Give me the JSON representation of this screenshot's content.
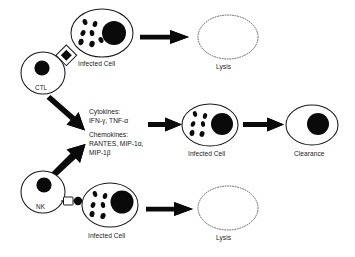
{
  "figure": {
    "background_color": "#ffffff",
    "ink_color": "#0a0a0a",
    "lysed_outline_color": "#555555"
  },
  "effector_cells": {
    "ctl": {
      "label": "CTL",
      "cx": 43,
      "cy": 73,
      "rx": 22,
      "ry": 21,
      "nucleus": {
        "cx": 42,
        "cy": 68,
        "r": 7.6
      },
      "granule": {
        "name": "lytic-granule",
        "cx": 67,
        "cy": 56,
        "outer_half": 8.2,
        "inner_half": 4.4
      }
    },
    "nk": {
      "label": "NK",
      "cx": 43,
      "cy": 192,
      "rx": 22,
      "ry": 21,
      "nucleus": {
        "cx": 44,
        "cy": 185,
        "r": 7.6
      },
      "receptor": {
        "name": "nk-receptor-bridge",
        "box": {
          "x": 63,
          "y": 197,
          "w": 9.5,
          "h": 8
        },
        "knob": {
          "cx": 78,
          "cy": 201,
          "r": 4.2
        }
      }
    }
  },
  "infected_cells": [
    {
      "id": "infected-cell-top",
      "label": "Infected Cell",
      "cx": 102,
      "cy": 33,
      "rx": 31,
      "ry": 24,
      "nucleus": {
        "cx": 114,
        "cy": 33,
        "r": 12
      },
      "virions": [
        {
          "cx": 85,
          "cy": 22,
          "rx": 2.3,
          "ry": 3.1,
          "rot": -18
        },
        {
          "cx": 95,
          "cy": 24,
          "rx": 2.3,
          "ry": 3.1,
          "rot": 12
        },
        {
          "cx": 83,
          "cy": 33,
          "rx": 2.3,
          "ry": 3.1,
          "rot": 25
        },
        {
          "cx": 92,
          "cy": 33,
          "rx": 2.3,
          "ry": 3.1,
          "rot": -10
        },
        {
          "cx": 81,
          "cy": 42,
          "rx": 2.6,
          "ry": 3.2,
          "rot": 8
        },
        {
          "cx": 92,
          "cy": 44,
          "rx": 2.6,
          "ry": 3.2,
          "rot": 20
        },
        {
          "cx": 101,
          "cy": 40,
          "rx": 2.3,
          "ry": 3.1,
          "rot": -25
        }
      ],
      "label_pos": {
        "x": 78,
        "y": 60
      }
    },
    {
      "id": "infected-cell-middle",
      "label": "Infected Cell",
      "cx": 210,
      "cy": 125,
      "rx": 28,
      "ry": 21,
      "nucleus": {
        "cx": 222,
        "cy": 124,
        "r": 11
      },
      "virions": [
        {
          "cx": 195,
          "cy": 114,
          "rx": 2.1,
          "ry": 2.9,
          "rot": -15
        },
        {
          "cx": 205,
          "cy": 116,
          "rx": 2.1,
          "ry": 2.9,
          "rot": 14
        },
        {
          "cx": 193,
          "cy": 124,
          "rx": 2.1,
          "ry": 2.9,
          "rot": 22
        },
        {
          "cx": 203,
          "cy": 124,
          "rx": 2.1,
          "ry": 2.9,
          "rot": -8
        },
        {
          "cx": 192,
          "cy": 133,
          "rx": 2.4,
          "ry": 3.0,
          "rot": 10
        },
        {
          "cx": 202,
          "cy": 134,
          "rx": 2.4,
          "ry": 3.0,
          "rot": 18
        }
      ],
      "label_pos": {
        "x": 188,
        "y": 150
      }
    },
    {
      "id": "infected-cell-bottom",
      "label": "Infected Cell",
      "cx": 110,
      "cy": 205,
      "rx": 28,
      "ry": 22,
      "nucleus": {
        "cx": 122,
        "cy": 202,
        "r": 11.5
      },
      "virions": [
        {
          "cx": 95,
          "cy": 194,
          "rx": 2.2,
          "ry": 3.0,
          "rot": -16
        },
        {
          "cx": 105,
          "cy": 196,
          "rx": 2.2,
          "ry": 3.0,
          "rot": 13
        },
        {
          "cx": 93,
          "cy": 205,
          "rx": 2.2,
          "ry": 3.0,
          "rot": 24
        },
        {
          "cx": 103,
          "cy": 205,
          "rx": 2.2,
          "ry": 3.0,
          "rot": -9
        },
        {
          "cx": 92,
          "cy": 214,
          "rx": 2.5,
          "ry": 3.1,
          "rot": 9
        },
        {
          "cx": 103,
          "cy": 216,
          "rx": 2.5,
          "ry": 3.1,
          "rot": 19
        }
      ],
      "label_pos": {
        "x": 88,
        "y": 232
      }
    }
  ],
  "outcomes": [
    {
      "id": "outcome-lysis-top",
      "label": "Lysis",
      "type": "lysed",
      "cx": 228,
      "cy": 37,
      "rx": 30,
      "ry": 22,
      "label_pos": {
        "x": 215,
        "y": 62
      }
    },
    {
      "id": "outcome-clearance",
      "label": "Clearance",
      "type": "cleared",
      "cx": 312,
      "cy": 125,
      "rx": 26,
      "ry": 20,
      "nucleus": {
        "cx": 318,
        "cy": 124,
        "r": 11
      },
      "label_pos": {
        "x": 294,
        "y": 150
      }
    },
    {
      "id": "outcome-lysis-bottom",
      "label": "Lysis",
      "type": "lysed",
      "cx": 228,
      "cy": 208,
      "rx": 30,
      "ry": 22,
      "label_pos": {
        "x": 215,
        "y": 233
      }
    }
  ],
  "mediators": {
    "name": "soluble-mediators-list",
    "pos": {
      "x": 89,
      "y": 107
    },
    "groups": [
      {
        "heading": "Cytokines:",
        "items": "IFN-γ, TNF-α"
      },
      {
        "heading": "Chemokines:",
        "items_line1": "RANTES, MIP-1α,",
        "items_line2": "MIP-1β"
      }
    ]
  },
  "arrows": [
    {
      "id": "arrow-top-lysis",
      "from": "infected-cell-top",
      "to": "outcome-lysis-top",
      "x1": 140,
      "y1": 37,
      "x2": 188,
      "y2": 37,
      "thickness": 4.6
    },
    {
      "id": "arrow-ctl-mediators",
      "from": "ctl",
      "to": "mediators",
      "x1": 50,
      "y1": 97,
      "x2": 84,
      "y2": 126,
      "thickness": 4.6
    },
    {
      "id": "arrow-nk-mediators",
      "from": "nk",
      "to": "mediators",
      "x1": 50,
      "y1": 174,
      "x2": 80,
      "y2": 143,
      "thickness": 4.6
    },
    {
      "id": "arrow-mediators-infected",
      "from": "mediators",
      "to": "infected-cell-middle",
      "x1": 148,
      "y1": 124,
      "x2": 180,
      "y2": 124,
      "thickness": 4.2
    },
    {
      "id": "arrow-infected-clearance",
      "from": "infected-cell-middle",
      "to": "outcome-clearance",
      "x1": 243,
      "y1": 124,
      "x2": 283,
      "y2": 124,
      "thickness": 4.2
    },
    {
      "id": "arrow-bottom-lysis",
      "from": "infected-cell-bottom",
      "to": "outcome-lysis-bottom",
      "x1": 146,
      "y1": 209,
      "x2": 192,
      "y2": 209,
      "thickness": 4.6
    }
  ]
}
